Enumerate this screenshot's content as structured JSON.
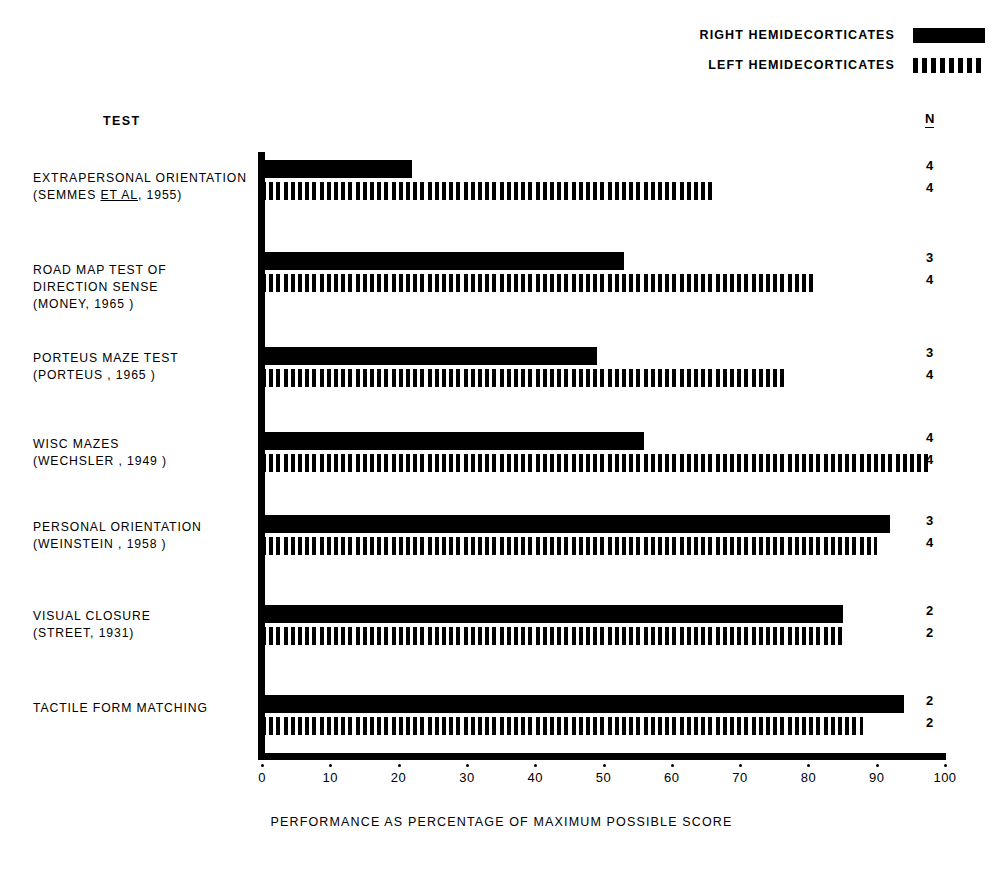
{
  "legend": {
    "entries": [
      {
        "label": "RIGHT  HEMIDECORTICATES",
        "style": "solid"
      },
      {
        "label": "LEFT   HEMIDECORTICATES",
        "style": "striped"
      }
    ]
  },
  "headers": {
    "test": "TEST",
    "n": "N"
  },
  "x_axis_title": "PERFORMANCE AS PERCENTAGE OF MAXIMUM POSSIBLE SCORE",
  "chart_data": {
    "type": "bar",
    "orientation": "horizontal",
    "title": "",
    "xlabel": "PERFORMANCE AS PERCENTAGE OF MAXIMUM POSSIBLE SCORE",
    "ylabel": "TEST",
    "xlim": [
      0,
      100
    ],
    "xticks": [
      0,
      10,
      20,
      30,
      40,
      50,
      60,
      70,
      80,
      90,
      100
    ],
    "xtick_labels": [
      "0",
      "10",
      "20",
      "30",
      "40",
      "50",
      "60",
      "70",
      "80",
      "90",
      "100"
    ],
    "grid": false,
    "legend_position": "top-right",
    "categories": [
      "EXTRAPERSONAL ORIENTATION (SEMMES ET AL, 1955)",
      "ROAD MAP TEST OF DIRECTION SENSE (MONEY, 1965)",
      "PORTEUS MAZE TEST (PORTEUS, 1965)",
      "WISC MAZES (WECHSLER, 1949)",
      "PERSONAL ORIENTATION (WEINSTEIN, 1958)",
      "VISUAL CLOSURE (STREET, 1931)",
      "TACTILE FORM MATCHING"
    ],
    "series": [
      {
        "name": "RIGHT  HEMIDECORTICATES",
        "style": "solid",
        "values": [
          22,
          53,
          49,
          56,
          92,
          85,
          94
        ]
      },
      {
        "name": "LEFT   HEMIDECORTICATES",
        "style": "striped",
        "values": [
          66,
          81,
          77,
          98,
          90,
          85,
          88
        ]
      }
    ],
    "n_values": [
      {
        "right": "4",
        "left": "4"
      },
      {
        "right": "3",
        "left": "4"
      },
      {
        "right": "3",
        "left": "4"
      },
      {
        "right": "4",
        "left": "4"
      },
      {
        "right": "3",
        "left": "4"
      },
      {
        "right": "2",
        "left": "2"
      },
      {
        "right": "2",
        "left": "2"
      }
    ]
  },
  "rows": [
    {
      "lines": [
        [
          {
            "t": "EXTRAPERSONAL ORIENTATION",
            "u": false
          }
        ],
        [
          {
            "t": "(SEMMES ",
            "u": false
          },
          {
            "t": "ET AL",
            "u": true
          },
          {
            "t": ", 1955)",
            "u": false
          }
        ]
      ]
    },
    {
      "lines": [
        [
          {
            "t": "ROAD MAP TEST OF",
            "u": false
          }
        ],
        [
          {
            "t": "DIRECTION SENSE",
            "u": false
          }
        ],
        [
          {
            "t": "(MONEY, 1965 )",
            "u": false
          }
        ]
      ]
    },
    {
      "lines": [
        [
          {
            "t": "PORTEUS MAZE TEST",
            "u": false
          }
        ],
        [
          {
            "t": "(PORTEUS , 1965 )",
            "u": false
          }
        ]
      ]
    },
    {
      "lines": [
        [
          {
            "t": "WISC  MAZES",
            "u": false
          }
        ],
        [
          {
            "t": "(WECHSLER , 1949 )",
            "u": false
          }
        ]
      ]
    },
    {
      "lines": [
        [
          {
            "t": "PERSONAL  ORIENTATION",
            "u": false
          }
        ],
        [
          {
            "t": "(WEINSTEIN , 1958 )",
            "u": false
          }
        ]
      ]
    },
    {
      "lines": [
        [
          {
            "t": "VISUAL CLOSURE",
            "u": false
          }
        ],
        [
          {
            "t": "(STREET, 1931)",
            "u": false
          }
        ]
      ]
    },
    {
      "lines": [
        [
          {
            "t": "TACTILE  FORM MATCHING",
            "u": false
          }
        ]
      ]
    }
  ],
  "layout": {
    "group_tops": [
      160,
      252,
      347,
      432,
      515,
      605,
      695
    ],
    "label_tops": [
      170,
      262,
      350,
      436,
      519,
      608,
      700
    ],
    "solid_h": 18,
    "striped_h": 18,
    "gap": 4
  }
}
